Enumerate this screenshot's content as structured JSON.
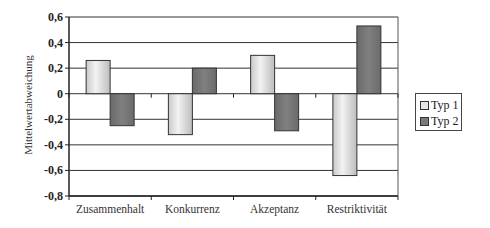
{
  "chart_data": {
    "type": "bar",
    "title": "",
    "xlabel": "",
    "ylabel": "Mittelwertabweichung",
    "categories": [
      "Zusammenhalt",
      "Konkurrenz",
      "Akzeptanz",
      "Restriktivität"
    ],
    "series": [
      {
        "name": "Typ 1",
        "values": [
          0.26,
          -0.32,
          0.3,
          -0.64
        ],
        "color": "#e6e6e6"
      },
      {
        "name": "Typ 2",
        "values": [
          -0.25,
          0.2,
          -0.29,
          0.53
        ],
        "color": "#7a7a7a"
      }
    ],
    "ylim": [
      -0.8,
      0.6
    ],
    "yticks": [
      0.6,
      0.4,
      0.2,
      0,
      -0.2,
      -0.4,
      -0.6,
      -0.8
    ],
    "ytick_labels": [
      "0,6",
      "0,4",
      "0,2",
      "0",
      "-0,2",
      "-0,4",
      "-0,6",
      "-0,8"
    ],
    "grid": true,
    "legend_position": "right"
  },
  "legend": {
    "items": [
      {
        "label": "Typ 1"
      },
      {
        "label": "Typ 2"
      }
    ]
  }
}
